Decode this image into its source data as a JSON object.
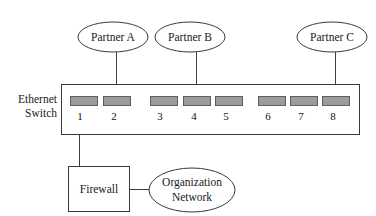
{
  "diagram": {
    "title_label": "Ethernet Switch Network Diagram",
    "colors": {
      "background": "#ffffff",
      "stroke": "#3a3a3a",
      "line": "#3f3f3f",
      "port_fill": "#9b9b9b",
      "port_stroke": "#5d5d5d",
      "text": "#1a1a1a"
    },
    "switch": {
      "label_line1": "Ethernet",
      "label_line2": "Switch",
      "box": {
        "x": 61,
        "y": 84,
        "width": 299,
        "height": 51
      },
      "label_x": 57,
      "label_y1": 100,
      "label_y2": 114,
      "ports": [
        {
          "number": "1",
          "x": 70,
          "y": 96,
          "width": 27,
          "height": 9,
          "label_x": 80,
          "label_y": 117
        },
        {
          "number": "2",
          "x": 103,
          "y": 96,
          "width": 27,
          "height": 9,
          "label_x": 114,
          "label_y": 117
        },
        {
          "number": "3",
          "x": 150,
          "y": 96,
          "width": 27,
          "height": 9,
          "label_x": 160,
          "label_y": 117
        },
        {
          "number": "4",
          "x": 183,
          "y": 96,
          "width": 27,
          "height": 9,
          "label_x": 194,
          "label_y": 117
        },
        {
          "number": "5",
          "x": 215,
          "y": 96,
          "width": 27,
          "height": 9,
          "label_x": 226,
          "label_y": 117
        },
        {
          "number": "6",
          "x": 258,
          "y": 96,
          "width": 27,
          "height": 9,
          "label_x": 268,
          "label_y": 117
        },
        {
          "number": "7",
          "x": 290,
          "y": 96,
          "width": 27,
          "height": 9,
          "label_x": 301,
          "label_y": 117
        },
        {
          "number": "8",
          "x": 322,
          "y": 96,
          "width": 27,
          "height": 9,
          "label_x": 333,
          "label_y": 117
        }
      ]
    },
    "partners": [
      {
        "label": "Partner A",
        "cx": 113,
        "cy": 37,
        "rx": 35,
        "ry": 15,
        "port": "2",
        "line_x": 116,
        "line_y1": 52,
        "line_y2": 96
      },
      {
        "label": "Partner B",
        "cx": 190,
        "cy": 37,
        "rx": 35,
        "ry": 15,
        "port": "4",
        "line_x": 196,
        "line_y1": 52,
        "line_y2": 96
      },
      {
        "label": "Partner C",
        "cx": 332,
        "cy": 37,
        "rx": 35,
        "ry": 15,
        "port": "8",
        "line_x": 335,
        "line_y1": 52,
        "line_y2": 96
      }
    ],
    "firewall": {
      "label": "Firewall",
      "box": {
        "x": 68,
        "y": 166,
        "width": 62,
        "height": 46
      },
      "label_x": 99,
      "label_y": 189,
      "uplink": {
        "x": 79,
        "y1": 105,
        "y2": 166,
        "port": "1"
      }
    },
    "organization_network": {
      "label_line1": "Organization",
      "label_line2": "Network",
      "ellipse": {
        "cx": 192,
        "cy": 190,
        "rx": 43,
        "ry": 22
      },
      "label_x": 192,
      "label_y1": 183,
      "label_y2": 197,
      "link": {
        "x1": 130,
        "x2": 152,
        "y": 189
      }
    }
  }
}
